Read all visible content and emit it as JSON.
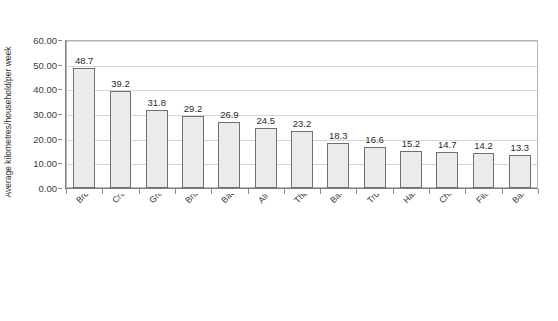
{
  "figure": {
    "cut_off_title_fragment": "journeys per household per week",
    "y_axis_label": "Average kilometres/household/per week"
  },
  "chart_data": {
    "type": "bar",
    "title": "",
    "xlabel": "",
    "ylabel": "Average kilometres/household/per week",
    "ylim": [
      0,
      60
    ],
    "ytick_labels": [
      "0.00",
      "10.00",
      "20.00",
      "30.00",
      "40.00",
      "50.00",
      "60.00"
    ],
    "ytick_values": [
      0,
      10,
      20,
      30,
      40,
      50,
      60
    ],
    "grid": true,
    "legend": "none",
    "categories": [
      "Broxbourne N=106",
      "Cramlington N=129",
      "Great Park N=131",
      "Bradley Stoke N=131",
      "Backworth and Shiremoor N=106",
      "All twelve areas together N=1490",
      "Thornbury N=161",
      "Bar Hill N=121",
      "Trumpington N=125",
      "Harrow N=105",
      "Cherry Hinton N=126",
      "Filton Avenue N=140",
      "Barking N=93"
    ],
    "values": [
      48.7,
      39.2,
      31.8,
      29.2,
      26.9,
      24.5,
      23.2,
      18.3,
      16.6,
      15.2,
      14.7,
      14.2,
      13.3
    ],
    "value_labels": [
      "48.7",
      "39.2",
      "31.8",
      "29.2",
      "26.9",
      "24.5",
      "23.2",
      "18.3",
      "16.6",
      "15.2",
      "14.7",
      "14.2",
      "13.3"
    ],
    "bar_fill_color": "#ebebeb",
    "bar_border_color": "#6f6f6f",
    "gridline_color": "#d6d6d6"
  }
}
